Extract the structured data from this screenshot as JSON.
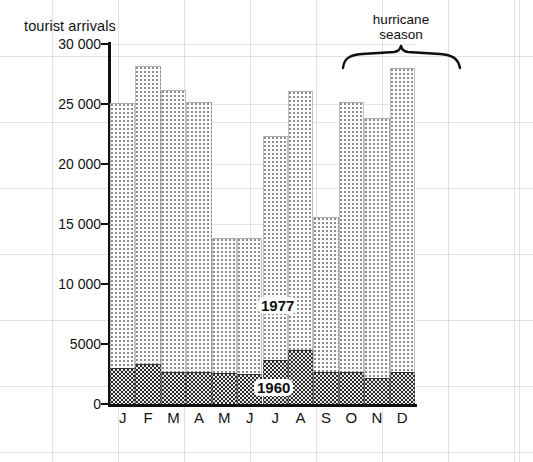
{
  "figure": {
    "axis_title": "tourist arrivals",
    "y_ticks": [
      "30 000",
      "25 000",
      "20 000",
      "15 000",
      "10 000",
      "5000",
      "0"
    ],
    "x_labels": [
      "J",
      "F",
      "M",
      "A",
      "M",
      "J",
      "J",
      "A",
      "S",
      "O",
      "N",
      "D"
    ],
    "annotations": {
      "series_upper": "1977",
      "series_lower": "1960",
      "bracket_line1": "hurricane",
      "bracket_line2": "season"
    },
    "colors": {
      "ink": "#111111",
      "series_1977_dots": "#8e8e8e",
      "series_1960_dots": "#2a2a2a",
      "page_grid": "#96a0af"
    }
  },
  "chart_data": {
    "type": "bar",
    "title": "",
    "subtitle": "",
    "xlabel": "",
    "ylabel": "tourist arrivals",
    "ylim": [
      0,
      30000
    ],
    "ytick_values": [
      0,
      5000,
      10000,
      15000,
      20000,
      25000,
      30000
    ],
    "grid": true,
    "legend_position": "inline-annotation",
    "categories": [
      "J",
      "F",
      "M",
      "A",
      "M",
      "J",
      "J",
      "A",
      "S",
      "O",
      "N",
      "D"
    ],
    "category_names": [
      "January",
      "February",
      "March",
      "April",
      "May",
      "June",
      "July",
      "August",
      "September",
      "October",
      "November",
      "December"
    ],
    "series": [
      {
        "name": "1977",
        "values": [
          25100,
          28200,
          26200,
          25200,
          13800,
          13800,
          22300,
          26100,
          15600,
          25200,
          23800,
          28000
        ]
      },
      {
        "name": "1960",
        "values": [
          3000,
          3300,
          2700,
          2700,
          2600,
          2500,
          3700,
          4500,
          2700,
          2700,
          2200,
          2700
        ]
      }
    ],
    "annotations": [
      {
        "text": "hurricane season",
        "type": "bracket",
        "spans_categories": [
          "A",
          "S",
          "O"
        ]
      }
    ]
  }
}
